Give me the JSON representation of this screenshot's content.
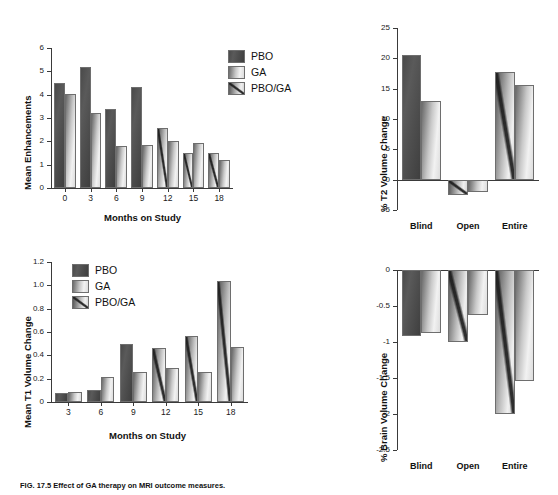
{
  "figure": {
    "caption": "FIG. 17.5  Effect of GA therapy on MRI outcome measures."
  },
  "legend": {
    "items": [
      {
        "label": "PBO",
        "style": "pbo",
        "color": "#4e4e4e"
      },
      {
        "label": "GA",
        "style": "ga",
        "color": "#d8d8d8"
      },
      {
        "label": "PBO/GA",
        "style": "pboga",
        "color": "#9a9a9a"
      }
    ]
  },
  "chart_data": [
    {
      "id": "mean-enhancements",
      "type": "bar",
      "title": "",
      "xlabel": "Months on Study",
      "ylabel": "Mean Enhancements",
      "categories": [
        "0",
        "3",
        "6",
        "9",
        "12",
        "15",
        "18"
      ],
      "yticks": [
        0,
        1,
        2,
        3,
        4,
        5,
        6
      ],
      "ylim": [
        0,
        6
      ],
      "grid": false,
      "legend_position": "top-right",
      "series": [
        {
          "name": "PBO",
          "style": "pbo",
          "values": [
            4.5,
            5.2,
            3.4,
            4.32,
            null,
            null,
            null
          ]
        },
        {
          "name": "PBO/GA",
          "style": "pboga",
          "values": [
            null,
            null,
            null,
            null,
            2.56,
            1.52,
            1.5
          ]
        },
        {
          "name": "GA",
          "style": "ga",
          "values": [
            4.04,
            3.22,
            1.78,
            1.86,
            2.02,
            1.94,
            1.2
          ]
        }
      ]
    },
    {
      "id": "t2-volume-change",
      "type": "bar",
      "title": "",
      "xlabel": "",
      "ylabel": "% T2 Volume Change",
      "categories": [
        "Blind",
        "Open",
        "Entire"
      ],
      "yticks": [
        -5,
        0,
        5,
        10,
        15,
        20,
        25
      ],
      "ylim": [
        -5,
        25
      ],
      "grid": false,
      "legend_position": "none",
      "series": [
        {
          "name": "PBO",
          "style": "pbo",
          "values": [
            20.5,
            null,
            null
          ]
        },
        {
          "name": "PBO/GA",
          "style": "pboga",
          "values": [
            null,
            -2.5,
            17.8
          ]
        },
        {
          "name": "GA",
          "style": "ga",
          "values": [
            13.0,
            -2.0,
            15.6
          ]
        }
      ]
    },
    {
      "id": "mean-t1-volume-change",
      "type": "bar",
      "title": "",
      "xlabel": "Months on Study",
      "ylabel": "Mean T1 Volume Change",
      "categories": [
        "3",
        "6",
        "9",
        "12",
        "15",
        "18"
      ],
      "yticks": [
        0,
        0.2,
        0.4,
        0.6,
        0.8,
        1.0,
        1.2
      ],
      "ytick_labels": [
        "0",
        "0.2",
        "0.4",
        "0.6",
        "0.8",
        "1.0",
        "1.2"
      ],
      "ylim": [
        0,
        1.2
      ],
      "grid": false,
      "legend_position": "top-left",
      "series": [
        {
          "name": "PBO",
          "style": "pbo",
          "values": [
            0.08,
            0.1,
            0.5,
            null,
            null,
            null
          ]
        },
        {
          "name": "PBO/GA",
          "style": "pboga",
          "values": [
            null,
            null,
            null,
            0.465,
            0.565,
            1.04
          ]
        },
        {
          "name": "GA",
          "style": "ga",
          "values": [
            0.085,
            0.215,
            0.255,
            0.295,
            0.255,
            0.47
          ]
        }
      ]
    },
    {
      "id": "brain-volume-change",
      "type": "bar",
      "title": "",
      "xlabel": "",
      "ylabel": "% Brain Volume Change",
      "categories": [
        "Blind",
        "Open",
        "Entire"
      ],
      "yticks": [
        -2.5,
        -2,
        -1.5,
        -1,
        -0.5,
        0
      ],
      "ytick_labels": [
        "-2.5",
        "-2",
        "-1.5",
        "-1",
        "-0.5",
        "0"
      ],
      "ylim": [
        -2.5,
        0
      ],
      "grid": false,
      "legend_position": "none",
      "series": [
        {
          "name": "PBO",
          "style": "pbo",
          "values": [
            -0.92,
            null,
            null
          ]
        },
        {
          "name": "PBO/GA",
          "style": "pboga",
          "values": [
            null,
            -1.0,
            -2.0
          ]
        },
        {
          "name": "GA",
          "style": "ga",
          "values": [
            -0.88,
            -0.63,
            -1.54
          ]
        }
      ]
    }
  ]
}
